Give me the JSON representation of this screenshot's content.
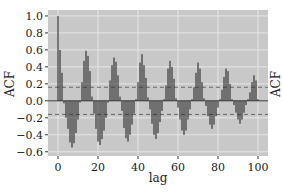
{
  "chart_data": {
    "type": "bar",
    "title": "",
    "xlabel": "lag",
    "ylabel": "ACF",
    "ylabel_right": "ACF",
    "xlim": [
      -5,
      105
    ],
    "ylim": [
      -0.65,
      1.07
    ],
    "xticks": [
      0,
      20,
      40,
      60,
      80,
      100
    ],
    "yticks": [
      -0.6,
      -0.4,
      -0.2,
      0.0,
      0.2,
      0.4,
      0.6,
      0.8,
      1.0
    ],
    "ytick_labels": [
      "−0.6",
      "−0.4",
      "−0.2",
      "0.0",
      "0.2",
      "0.4",
      "0.6",
      "0.8",
      "1.0"
    ],
    "grid": true,
    "background": "#c8c8c8",
    "bar_color": "#2a2a2a",
    "confidence_band": 0.16,
    "x": [
      0,
      1,
      2,
      3,
      4,
      5,
      6,
      7,
      8,
      9,
      10,
      11,
      12,
      13,
      14,
      15,
      16,
      17,
      18,
      19,
      20,
      21,
      22,
      23,
      24,
      25,
      26,
      27,
      28,
      29,
      30,
      31,
      32,
      33,
      34,
      35,
      36,
      37,
      38,
      39,
      40,
      41,
      42,
      43,
      44,
      45,
      46,
      47,
      48,
      49,
      50,
      51,
      52,
      53,
      54,
      55,
      56,
      57,
      58,
      59,
      60,
      61,
      62,
      63,
      64,
      65,
      66,
      67,
      68,
      69,
      70,
      71,
      72,
      73,
      74,
      75,
      76,
      77,
      78,
      79,
      80,
      81,
      82,
      83,
      84,
      85,
      86,
      87,
      88,
      89,
      90,
      91,
      92,
      93,
      94,
      95,
      96,
      97,
      98,
      99,
      100
    ],
    "values": [
      1.0,
      0.6,
      0.33,
      -0.03,
      -0.2,
      -0.33,
      -0.49,
      -0.55,
      -0.5,
      -0.38,
      -0.22,
      -0.02,
      0.22,
      0.47,
      0.59,
      0.53,
      0.35,
      0.05,
      -0.15,
      -0.33,
      -0.48,
      -0.52,
      -0.45,
      -0.35,
      -0.2,
      -0.02,
      0.24,
      0.42,
      0.51,
      0.46,
      0.3,
      0.05,
      -0.12,
      -0.32,
      -0.44,
      -0.48,
      -0.4,
      -0.28,
      -0.15,
      0.02,
      0.22,
      0.45,
      0.55,
      0.42,
      0.27,
      0.04,
      -0.1,
      -0.27,
      -0.4,
      -0.45,
      -0.38,
      -0.25,
      -0.12,
      0.02,
      0.18,
      0.38,
      0.47,
      0.4,
      0.26,
      0.03,
      -0.08,
      -0.22,
      -0.35,
      -0.4,
      -0.35,
      -0.22,
      -0.1,
      0.02,
      0.16,
      0.33,
      0.45,
      0.38,
      0.22,
      0.03,
      -0.06,
      -0.18,
      -0.28,
      -0.33,
      -0.28,
      -0.18,
      -0.08,
      0.02,
      0.13,
      0.28,
      0.38,
      0.35,
      0.2,
      0.02,
      -0.05,
      -0.14,
      -0.22,
      -0.27,
      -0.22,
      -0.14,
      -0.05,
      0.02,
      0.1,
      0.22,
      0.3,
      0.24,
      0.02
    ]
  }
}
